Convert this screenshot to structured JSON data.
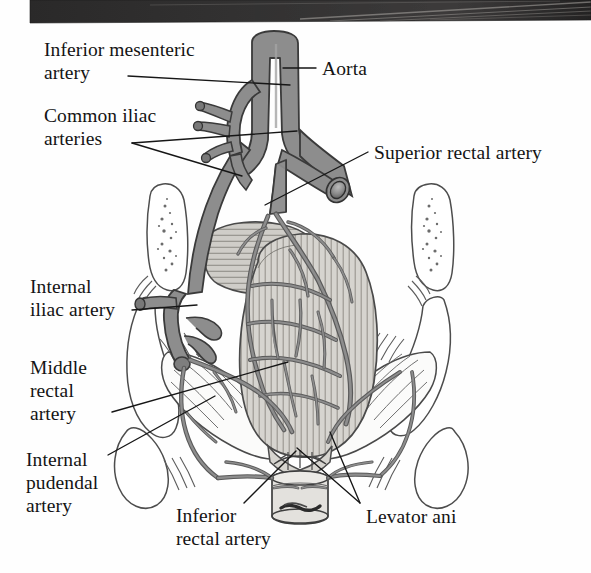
{
  "figure": {
    "kind": "anatomical-illustration",
    "background_color": "#fefefe",
    "scan_edge": {
      "name": "scan-edge-band",
      "color": "#2e2d2d",
      "x": 30,
      "y": 0,
      "width": 561,
      "height": 22
    },
    "palette": {
      "artery_fill": "#8d8d8d",
      "artery_outline": "#3a3a3a",
      "rectum_fill": "#d6d4cf",
      "rectum_stripe": "#8f8d88",
      "bone_fill": "#ffffff",
      "bone_outline": "#4a4a4a",
      "stipple": "#6f6f6f",
      "leader_line": "#161616",
      "text": "#141414"
    }
  },
  "labels": [
    {
      "id": "inferior-mesenteric-artery",
      "lines": [
        "Inferior mesenteric",
        "artery"
      ],
      "x": 44,
      "y": 38,
      "leaders": [
        [
          [
            128,
            76
          ],
          [
            290,
            85
          ]
        ]
      ]
    },
    {
      "id": "aorta",
      "lines": [
        "Aorta"
      ],
      "x": 322,
      "y": 57,
      "leaders": [
        [
          [
            316,
            68
          ],
          [
            283,
            68
          ]
        ]
      ]
    },
    {
      "id": "common-iliac-arteries",
      "lines": [
        "Common iliac",
        "arteries"
      ],
      "x": 44,
      "y": 104,
      "leaders": [
        [
          [
            132,
            143
          ],
          [
            297,
            131
          ]
        ],
        [
          [
            132,
            143
          ],
          [
            242,
            176
          ]
        ]
      ]
    },
    {
      "id": "superior-rectal-artery",
      "lines": [
        "Superior rectal artery"
      ],
      "x": 374,
      "y": 141,
      "leaders": [
        [
          [
            368,
            152
          ],
          [
            265,
            205
          ]
        ]
      ]
    },
    {
      "id": "internal-iliac-artery",
      "lines": [
        "Internal",
        "iliac artery"
      ],
      "x": 30,
      "y": 275,
      "leaders": [
        [
          [
            132,
            310
          ],
          [
            197,
            305
          ]
        ]
      ]
    },
    {
      "id": "middle-rectal-artery",
      "lines": [
        "Middle",
        "rectal",
        "artery"
      ],
      "x": 30,
      "y": 356,
      "leaders": [
        [
          [
            112,
            412
          ],
          [
            288,
            362
          ]
        ]
      ]
    },
    {
      "id": "internal-pudendal-artery",
      "lines": [
        "Internal",
        "pudendal",
        "artery"
      ],
      "x": 26,
      "y": 448,
      "leaders": [
        [
          [
            108,
            455
          ],
          [
            215,
            396
          ]
        ]
      ]
    },
    {
      "id": "inferior-rectal-artery",
      "lines": [
        "Inferior",
        "rectal artery"
      ],
      "x": 176,
      "y": 504,
      "leaders": [
        [
          [
            244,
            503
          ],
          [
            296,
            451
          ]
        ]
      ]
    },
    {
      "id": "levator-ani",
      "lines": [
        "Levator ani"
      ],
      "x": 366,
      "y": 505,
      "leaders": [
        [
          [
            360,
            503
          ],
          [
            330,
            432
          ]
        ],
        [
          [
            360,
            503
          ],
          [
            297,
            448
          ]
        ]
      ]
    }
  ],
  "structures": [
    {
      "id": "aorta",
      "label": "Aorta"
    },
    {
      "id": "inferior-mesenteric-artery",
      "label": "Inferior mesenteric artery"
    },
    {
      "id": "common-iliac-artery-left",
      "label": "Common iliac artery (left)"
    },
    {
      "id": "common-iliac-artery-right",
      "label": "Common iliac artery (right)"
    },
    {
      "id": "internal-iliac-artery",
      "label": "Internal iliac artery"
    },
    {
      "id": "superior-rectal-artery",
      "label": "Superior rectal artery"
    },
    {
      "id": "middle-rectal-artery",
      "label": "Middle rectal artery"
    },
    {
      "id": "inferior-rectal-artery",
      "label": "Inferior rectal artery"
    },
    {
      "id": "internal-pudendal-artery",
      "label": "Internal pudendal artery"
    },
    {
      "id": "rectum",
      "label": "Rectum"
    },
    {
      "id": "anal-canal",
      "label": "Anal canal"
    },
    {
      "id": "levator-ani-left",
      "label": "Levator ani (left)"
    },
    {
      "id": "levator-ani-right",
      "label": "Levator ani (right)"
    },
    {
      "id": "sacrum",
      "label": "Sacrum / pelvic bone"
    }
  ]
}
